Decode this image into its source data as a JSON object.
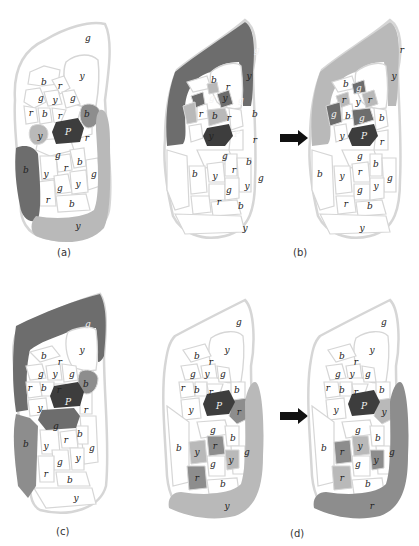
{
  "figure": {
    "captions": [
      "(a)",
      "(b)",
      "(c)",
      "(d)"
    ],
    "colors": {
      "white": "#ffffff",
      "outline": "#d6d6d6",
      "light_gray": "#b9b9b9",
      "mid_gray": "#8d8d8d",
      "dark_gray": "#6d6d6d",
      "darkest": "#3d3d3d"
    },
    "arrow_icon": "right-arrow",
    "panels": {
      "a": {
        "outer_top": "g",
        "top_right_y": "y",
        "cells": {
          "c1": "b",
          "c2": "r",
          "c3": "g",
          "c4": "y",
          "c5": "g",
          "c6": "r",
          "c7": "b",
          "c8": "r",
          "c9": "b",
          "c10": "y",
          "c11": "P",
          "c12": "r",
          "c13": "g",
          "c14": "b",
          "c15": "y",
          "c16": "r",
          "c17": "b",
          "c18": "g",
          "c19": "g",
          "c20": "y",
          "c21": "r",
          "c22": "b"
        },
        "left_band": "b",
        "bottom_band": "y"
      },
      "b_before": {
        "outer_top": "g",
        "top_right_y": "y",
        "cells": {
          "c1": "b",
          "c2": "r",
          "c3": "g",
          "c4": "y",
          "c5": "g",
          "c6": "r",
          "c7": "b",
          "c8": "r",
          "c9": "b",
          "c10": "y",
          "c11": "P",
          "c12": "r",
          "c13": "g",
          "c14": "b",
          "c15": "y",
          "c16": "r",
          "c17": "b",
          "c18": "g",
          "c19": "g",
          "c20": "y",
          "c21": "r",
          "c22": "b"
        },
        "bottom_band": "y"
      },
      "b_after": {
        "outer_top": "r",
        "top_right_y": "y",
        "cells": {
          "c1": "b",
          "c2": "g",
          "c3": "r",
          "c4": "y",
          "c5": "r",
          "c6": "g",
          "c7": "b",
          "c8": "g",
          "c9": "b",
          "c10": "y",
          "c11": "P",
          "c12": "r",
          "c13": "g",
          "c14": "b",
          "c15": "y",
          "c16": "r",
          "c17": "b",
          "c18": "g",
          "c19": "g",
          "c20": "y",
          "c21": "r",
          "c22": "b"
        },
        "bottom_band": "y"
      },
      "c": {
        "outer_top": "g",
        "top_right_y": "y",
        "cells": {
          "c1": "b",
          "c2": "r",
          "c3": "g",
          "c4": "y",
          "c5": "g",
          "c6": "r",
          "c7": "b",
          "c8": "r",
          "c9": "b",
          "c10": "y",
          "c11": "P",
          "c12": "r",
          "c13": "g",
          "c14": "b",
          "c15": "y",
          "c16": "r",
          "c17": "b",
          "c18": "g",
          "c19": "g",
          "c20": "y",
          "c21": "r",
          "c22": "b"
        },
        "left_band": "b",
        "bottom_band": "y"
      },
      "d_before": {
        "outer_top": "g",
        "top_right_y": "y",
        "cells": {
          "c1": "b",
          "c2": "r",
          "c3": "g",
          "c4": "y",
          "c5": "g",
          "c6": "r",
          "c7": "b",
          "c8": "r",
          "c9": "b",
          "c10": "y",
          "c11": "P",
          "c12": "r",
          "c13": "g",
          "c14": "b",
          "c15": "y",
          "c16": "r",
          "c17": "b",
          "c18": "g",
          "c19": "g",
          "c20": "y",
          "c21": "r",
          "c22": "b"
        },
        "bottom_band": "y"
      },
      "d_after": {
        "outer_top": "g",
        "top_right_y": "y",
        "cells": {
          "c1": "b",
          "c2": "r",
          "c3": "g",
          "c4": "y",
          "c5": "g",
          "c6": "r",
          "c7": "b",
          "c8": "r",
          "c9": "b",
          "c10": "y",
          "c11": "P",
          "c12": "y",
          "c13": "g",
          "c14": "b",
          "c15": "r",
          "c16": "y",
          "c17": "b",
          "c18": "g",
          "c19": "g",
          "c20": "y",
          "c21": "r",
          "c22": "b"
        },
        "bottom_band": "r"
      }
    }
  }
}
